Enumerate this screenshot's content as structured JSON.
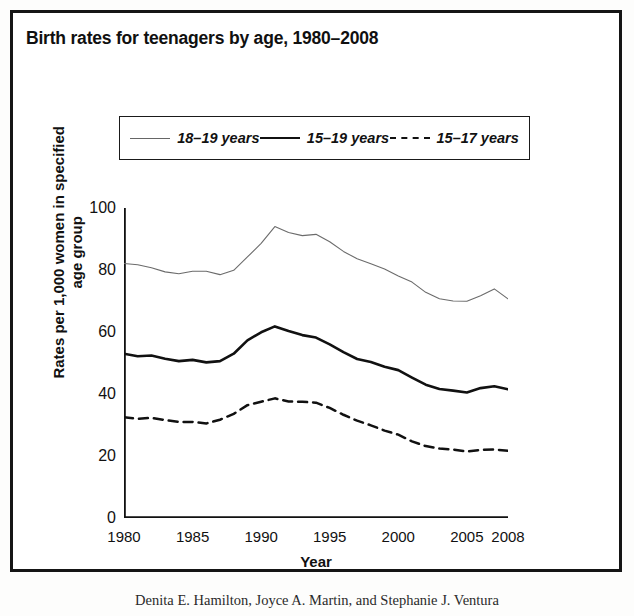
{
  "figure": {
    "title": "Birth rates for teenagers by age, 1980–2008",
    "caption": "Denita E. Hamilton, Joyce A. Martin, and Stephanie J. Ventura"
  },
  "legend": {
    "items": [
      {
        "label": "18–19 years",
        "style": "thin-solid",
        "color": "#6b6b6b"
      },
      {
        "label": "15–19 years",
        "style": "thick-solid",
        "color": "#111111"
      },
      {
        "label": "15–17 years",
        "style": "dashed",
        "color": "#111111"
      }
    ]
  },
  "axes": {
    "y_title_line1": "Rates per 1,000 women in specified",
    "y_title_line2": "age group",
    "x_title": "Year",
    "y_ticks": [
      "0",
      "20",
      "40",
      "60",
      "80",
      "100"
    ],
    "x_ticks": [
      "1980",
      "1985",
      "1990",
      "1995",
      "2000",
      "2005",
      "2008"
    ]
  },
  "chart_data": {
    "type": "line",
    "title": "Birth rates for teenagers by age, 1980–2008",
    "xlabel": "Year",
    "ylabel": "Rates per 1,000 women in specified age group",
    "xlim": [
      1980,
      2008
    ],
    "ylim": [
      0,
      100
    ],
    "yticks": [
      0,
      20,
      40,
      60,
      80,
      100
    ],
    "xticks": [
      1980,
      1985,
      1990,
      1995,
      2000,
      2005,
      2008
    ],
    "grid": false,
    "legend_position": "top-center",
    "x": [
      1980,
      1981,
      1982,
      1983,
      1984,
      1985,
      1986,
      1987,
      1988,
      1989,
      1990,
      1991,
      1992,
      1993,
      1994,
      1995,
      1996,
      1997,
      1998,
      1999,
      2000,
      2001,
      2002,
      2003,
      2004,
      2005,
      2006,
      2007,
      2008
    ],
    "series": [
      {
        "name": "18–19 years",
        "style": "thin-solid",
        "color": "#6b6b6b",
        "values": [
          82.1,
          81.7,
          80.7,
          79.4,
          78.8,
          79.6,
          79.6,
          78.5,
          79.9,
          84.2,
          88.6,
          94.0,
          92.1,
          91.1,
          91.5,
          89.1,
          86.0,
          83.6,
          82.0,
          80.3,
          78.1,
          76.1,
          72.8,
          70.7,
          70.0,
          69.9,
          71.7,
          73.9,
          70.7
        ]
      },
      {
        "name": "15–19 years",
        "style": "thick-solid",
        "color": "#111111",
        "values": [
          53.0,
          52.2,
          52.4,
          51.4,
          50.6,
          51.0,
          50.2,
          50.6,
          53.0,
          57.3,
          59.9,
          61.8,
          60.3,
          59.0,
          58.2,
          56.0,
          53.5,
          51.3,
          50.3,
          48.8,
          47.7,
          45.3,
          43.0,
          41.6,
          41.1,
          40.5,
          41.9,
          42.5,
          41.5
        ]
      },
      {
        "name": "15–17 years",
        "style": "dashed",
        "color": "#111111",
        "values": [
          32.5,
          32.0,
          32.3,
          31.6,
          31.0,
          31.0,
          30.5,
          31.7,
          33.6,
          36.4,
          37.5,
          38.6,
          37.6,
          37.5,
          37.2,
          35.5,
          33.3,
          31.4,
          29.9,
          28.2,
          26.9,
          24.7,
          23.2,
          22.4,
          22.1,
          21.4,
          22.0,
          22.1,
          21.7
        ]
      }
    ]
  }
}
